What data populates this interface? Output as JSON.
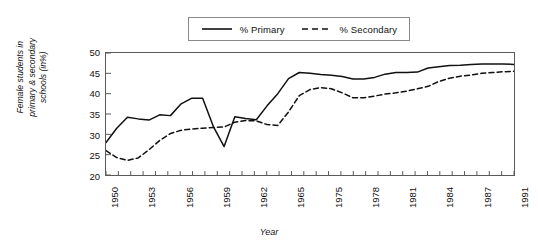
{
  "chart_data": {
    "type": "line",
    "title": "",
    "xlabel": "Year",
    "ylabel": "Female students in primary & secondary schools (in%)",
    "ylabel_lines": [
      "Female students in",
      "primary & secondary",
      "schools (in%)"
    ],
    "ylim": [
      20,
      50
    ],
    "ytick_values": [
      50,
      45,
      40,
      35,
      30,
      25,
      20
    ],
    "grid": false,
    "legend_position": "top-center",
    "line_color": "#111111",
    "x_tick_count": 34,
    "x_tick_labels": [
      "1950",
      "",
      "",
      "1953",
      "",
      "",
      "1956",
      "",
      "",
      "1959",
      "",
      "",
      "1962",
      "",
      "",
      "1965",
      "",
      "",
      "1975",
      "",
      "",
      "1978",
      "",
      "",
      "1981",
      "",
      "",
      "1984",
      "",
      "",
      "1987",
      "",
      "",
      "1991",
      "",
      "",
      "1994",
      "",
      "",
      "1997"
    ],
    "x_labeled_ticks": [
      "1950",
      "1953",
      "1956",
      "1959",
      "1962",
      "1965",
      "1975",
      "1978",
      "1981",
      "1984",
      "1987",
      "1991",
      "1994",
      "1997"
    ],
    "x": [
      1950,
      1951,
      1952,
      1953,
      1954,
      1955,
      1956,
      1957,
      1958,
      1959,
      1960,
      1961,
      1962,
      1963,
      1964,
      1965,
      1966,
      1967,
      1975,
      1976,
      1977,
      1978,
      1979,
      1980,
      1981,
      1982,
      1983,
      1984,
      1985,
      1986,
      1987,
      1991,
      1992,
      1993,
      1994,
      1995,
      1996,
      1997,
      1998
    ],
    "series": [
      {
        "name": "% Primary",
        "style": "solid",
        "values": [
          28.0,
          31.5,
          34.2,
          33.8,
          33.5,
          34.8,
          34.6,
          37.5,
          38.9,
          38.9,
          31.9,
          27.0,
          34.3,
          33.9,
          33.6,
          37.0,
          40.0,
          43.7,
          45.2,
          45.0,
          44.7,
          44.5,
          44.2,
          43.6,
          43.6,
          44.0,
          44.8,
          45.2,
          45.2,
          45.3,
          46.3,
          46.6,
          46.9,
          47.0,
          47.2,
          47.3,
          47.3,
          47.3,
          47.2
        ]
      },
      {
        "name": "% Secondary",
        "style": "dashed",
        "values": [
          26.0,
          24.3,
          23.6,
          24.2,
          26.2,
          28.5,
          30.2,
          31.0,
          31.3,
          31.5,
          31.7,
          31.8,
          33.0,
          33.4,
          33.3,
          32.4,
          32.2,
          35.5,
          39.5,
          41.0,
          41.5,
          41.2,
          40.2,
          39.0,
          39.0,
          39.4,
          39.9,
          40.2,
          40.6,
          41.2,
          41.8,
          43.0,
          43.8,
          44.3,
          44.6,
          45.0,
          45.2,
          45.4,
          45.5
        ]
      }
    ]
  },
  "legend": {
    "entries": [
      {
        "label": "% Primary",
        "style": "solid"
      },
      {
        "label": "% Secondary",
        "style": "dashed"
      }
    ]
  },
  "axes": {
    "x_title": "Year",
    "y_title_line1": "Female students in",
    "y_title_line2": "primary & secondary",
    "y_title_line3": "schools (in%)"
  }
}
